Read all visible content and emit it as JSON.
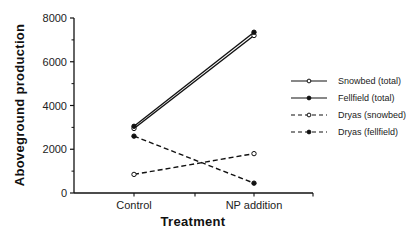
{
  "chart_data": {
    "type": "line",
    "title": "",
    "xlabel": "Treatment",
    "ylabel": "Aboveground production",
    "categories": [
      "Control",
      "NP addition"
    ],
    "ylim": [
      0,
      8000
    ],
    "yticks": [
      0,
      2000,
      4000,
      6000,
      8000
    ],
    "ytick_labels": [
      "0",
      "2000",
      "4000",
      "6000",
      "8000"
    ],
    "grid": false,
    "legend_position": "right",
    "series": [
      {
        "name": "Snowbed (total)",
        "values": [
          2950,
          7200
        ],
        "line": "solid",
        "marker": "open-circle",
        "color": "#111111"
      },
      {
        "name": "Fellfield (total)",
        "values": [
          3050,
          7350
        ],
        "line": "solid",
        "marker": "filled-circle",
        "color": "#111111"
      },
      {
        "name": "Dryas (snowbed)",
        "values": [
          850,
          1800
        ],
        "line": "dashed",
        "marker": "open-circle",
        "color": "#111111"
      },
      {
        "name": "Dryas (fellfield)",
        "values": [
          2600,
          450
        ],
        "line": "dashed",
        "marker": "filled-circle",
        "color": "#111111"
      }
    ]
  }
}
